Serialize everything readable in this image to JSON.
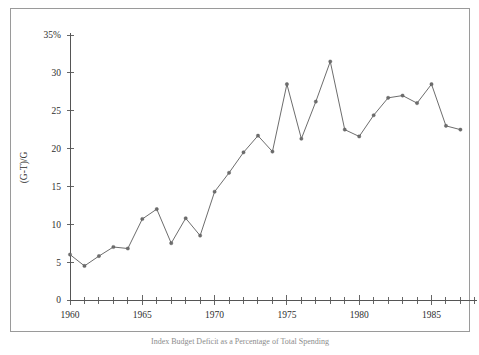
{
  "figure": {
    "caption": "Index Budget Deficit as a Percentage of Total Spending",
    "frame_color": "#9a9a9a",
    "line_color": "#6d6d6d",
    "background": "#ffffff"
  },
  "chart_data": {
    "type": "line",
    "title": "",
    "xlabel": "",
    "ylabel": "(G-T)/G",
    "ylim": [
      0,
      35
    ],
    "xlim": [
      1960,
      1988
    ],
    "grid": false,
    "legend": "none",
    "markers": true,
    "y_tick_labels": [
      "0",
      "5",
      "10",
      "15",
      "20",
      "25",
      "30",
      "35%"
    ],
    "y_ticks": [
      0,
      5,
      10,
      15,
      20,
      25,
      30,
      35
    ],
    "x_tick_labels": [
      "1960",
      "1965",
      "1970",
      "1975",
      "1980",
      "1985"
    ],
    "x_major_ticks": [
      1960,
      1965,
      1970,
      1975,
      1980,
      1985
    ],
    "x_minor_tick_step": 1,
    "x": [
      1960,
      1961,
      1962,
      1963,
      1964,
      1965,
      1966,
      1967,
      1968,
      1969,
      1970,
      1971,
      1972,
      1973,
      1974,
      1975,
      1976,
      1977,
      1978,
      1979,
      1980,
      1981,
      1982,
      1983,
      1984,
      1985,
      1986,
      1987
    ],
    "values": [
      6.0,
      4.5,
      5.8,
      7.0,
      6.8,
      10.7,
      12.0,
      7.5,
      10.8,
      8.5,
      14.3,
      16.8,
      19.5,
      21.7,
      19.6,
      28.5,
      21.3,
      26.2,
      31.5,
      22.5,
      21.6,
      24.4,
      26.7,
      27.0,
      26.0,
      28.5,
      23.0,
      22.5
    ],
    "series": [
      {
        "name": "(G-T)/G",
        "values": [
          6.0,
          4.5,
          5.8,
          7.0,
          6.8,
          10.7,
          12.0,
          7.5,
          10.8,
          8.5,
          14.3,
          16.8,
          19.5,
          21.7,
          19.6,
          28.5,
          21.3,
          26.2,
          31.5,
          22.5,
          21.6,
          24.4,
          26.7,
          27.0,
          26.0,
          28.5,
          23.0,
          22.5
        ]
      }
    ]
  }
}
